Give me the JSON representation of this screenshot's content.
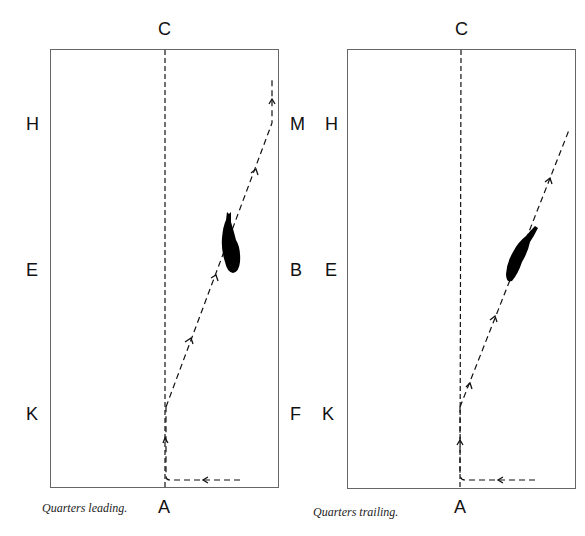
{
  "header": {
    "partial_title": "DRESSAGE WORK"
  },
  "diagrams": [
    {
      "id": "left",
      "caption": "Quarters leading.",
      "markers": {
        "top": "C",
        "bottom": "A",
        "left": [
          "H",
          "E",
          "K"
        ],
        "right": [
          "M",
          "B",
          "F"
        ]
      }
    },
    {
      "id": "right",
      "caption": "Quarters trailing.",
      "markers": {
        "top": "C",
        "bottom": "A",
        "left": [
          "H",
          "E",
          "K"
        ]
      }
    }
  ],
  "colors": {
    "line": "#111111",
    "border": "#666666",
    "horse": "#000000"
  }
}
